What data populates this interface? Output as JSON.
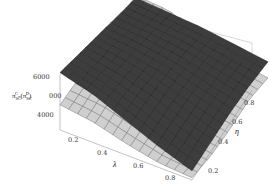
{
  "chart_data": {
    "type": "surface3d",
    "title": "",
    "xlabel": "λ",
    "ylabel": "η",
    "zlabel": "π_SC^C - (π_SC^D)",
    "zlabel_display": {
      "main": "π",
      "sub1": "SC",
      "sup1": "C",
      "mid": "-(π",
      "sub2": "SC",
      "sup2": "D",
      "tail": ")"
    },
    "x_ticks": [
      "0.2",
      "0.4",
      "0.6",
      "0.8"
    ],
    "y_ticks": [
      "0.2",
      "0.4",
      "0.6",
      "0.8"
    ],
    "z_ticks": [
      "4000",
      "5000",
      "6000"
    ],
    "xlim": [
      0.1,
      0.9
    ],
    "ylim": [
      0.1,
      0.9
    ],
    "zlim": [
      3500,
      6200
    ],
    "box": true,
    "grid_mesh": "15x15",
    "series": [
      {
        "name": "π_SC^C",
        "color": "#3a3a3a",
        "description": "dark surface, high along lower-λ / high-η edge, sloping down toward high λ and low η",
        "x": [
          0.1,
          0.3,
          0.5,
          0.7,
          0.9
        ],
        "y": [
          0.1,
          0.3,
          0.5,
          0.7,
          0.9
        ],
        "z": [
          [
            6000,
            6050,
            6100,
            6150,
            6200
          ],
          [
            5600,
            5800,
            5950,
            6050,
            6100
          ],
          [
            5000,
            5400,
            5700,
            5900,
            6000
          ],
          [
            4400,
            4900,
            5300,
            5600,
            5800
          ],
          [
            3900,
            4400,
            4900,
            5300,
            5600
          ]
        ]
      },
      {
        "name": "π_SC^D",
        "color": "#c8c8c8",
        "description": "light surface, ridged; peaks near mid-λ at high η and at low λ at low η",
        "x": [
          0.1,
          0.3,
          0.5,
          0.7,
          0.9
        ],
        "y": [
          0.1,
          0.3,
          0.5,
          0.7,
          0.9
        ],
        "z": [
          [
            4600,
            5000,
            5500,
            6000,
            6300
          ],
          [
            4400,
            4900,
            5400,
            5900,
            6200
          ],
          [
            4000,
            4500,
            5000,
            5500,
            5600
          ],
          [
            3700,
            4000,
            4500,
            5000,
            5100
          ],
          [
            3600,
            3800,
            4200,
            4700,
            4900
          ]
        ]
      }
    ]
  },
  "colors": {
    "dark_surface": "#3d3d3d",
    "dark_mesh": "#1c1c1c",
    "light_surface": "#cfcfcf",
    "light_mesh": "#6e6e6e",
    "box": "#b8b8b8",
    "text": "#333333"
  }
}
